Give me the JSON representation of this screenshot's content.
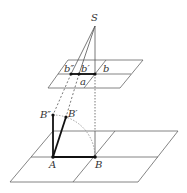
{
  "diagram": {
    "labels": {
      "S": "S",
      "b_double_prime": "b″",
      "b_prime": "b′",
      "b": "b",
      "a": "a",
      "B_double_prime": "B″",
      "B_prime": "B′",
      "A": "A",
      "B": "B"
    },
    "colors": {
      "line": "#555555",
      "bold": "#222222",
      "dotted": "#888888"
    }
  }
}
